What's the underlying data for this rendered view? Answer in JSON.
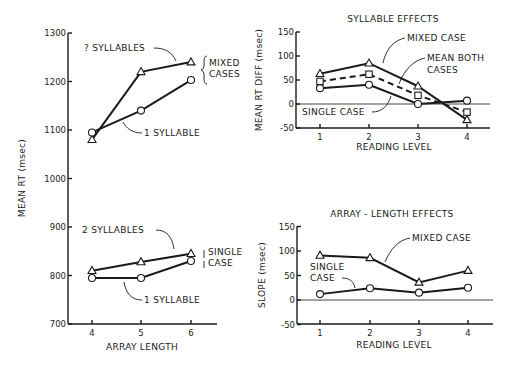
{
  "chart_data": [
    {
      "id": "array_length_rt",
      "type": "line",
      "title": "",
      "xlabel": "ARRAY LENGTH",
      "ylabel": "MEAN RT (msec)",
      "x": [
        4,
        5,
        6
      ],
      "x_tick_labels": [
        "4",
        "5",
        "6"
      ],
      "y_ticks": [
        700,
        800,
        900,
        1000,
        1100,
        1200,
        1300
      ],
      "ylim": [
        700,
        1300
      ],
      "grid": false,
      "groups": [
        {
          "name": "MIXED CASES",
          "series": [
            {
              "name": "2 SYLLABLES",
              "label_text": "? SYLLABLES",
              "marker": "triangle",
              "values": [
                1080,
                1220,
                1240
              ]
            },
            {
              "name": "1 SYLLABLE",
              "label_text": "1 SYLLABLE",
              "marker": "circle",
              "values": [
                1095,
                1140,
                1203
              ]
            }
          ]
        },
        {
          "name": "SINGLE CASE",
          "series": [
            {
              "name": "2 SYLLABLES",
              "label_text": "2 SYLLABLES",
              "marker": "triangle",
              "values": [
                810,
                828,
                845
              ]
            },
            {
              "name": "1 SYLLABLE",
              "label_text": "1 SYLLABLE",
              "marker": "circle",
              "values": [
                795,
                795,
                830
              ]
            }
          ]
        }
      ]
    },
    {
      "id": "syllable_effects",
      "type": "line",
      "title": "SYLLABLE EFFECTS",
      "xlabel": "READING LEVEL",
      "ylabel": "MEAN RT DIFF (msec)",
      "x": [
        1,
        2,
        3,
        4
      ],
      "x_tick_labels": [
        "1",
        "2",
        "3",
        "4"
      ],
      "y_ticks": [
        -50,
        0,
        50,
        100,
        150
      ],
      "ylim": [
        -50,
        150
      ],
      "zero_line": true,
      "grid": false,
      "series": [
        {
          "name": "MIXED CASE",
          "marker": "triangle",
          "line": "solid",
          "values": [
            63,
            85,
            37,
            -33
          ]
        },
        {
          "name": "MEAN BOTH CASES",
          "marker": "square",
          "line": "dashed",
          "values": [
            47,
            62,
            18,
            -17
          ]
        },
        {
          "name": "SINGLE CASE",
          "marker": "circle",
          "line": "solid",
          "values": [
            33,
            40,
            0,
            7
          ]
        }
      ]
    },
    {
      "id": "array_length_effects",
      "type": "line",
      "title": "ARRAY-LENGTH EFFECTS",
      "xlabel": "READING LEVEL",
      "ylabel": "SLOPE (msec)",
      "x": [
        1,
        2,
        3,
        4
      ],
      "x_tick_labels": [
        "1",
        "2",
        "3",
        "4"
      ],
      "y_ticks": [
        -50,
        0,
        50,
        100,
        150
      ],
      "ylim": [
        -50,
        150
      ],
      "zero_line": true,
      "grid": false,
      "series": [
        {
          "name": "MIXED CASE",
          "marker": "triangle",
          "line": "solid",
          "values": [
            91,
            86,
            36,
            60
          ]
        },
        {
          "name": "SINGLE CASE",
          "marker": "circle",
          "line": "solid",
          "values": [
            12,
            24,
            15,
            25
          ]
        }
      ]
    }
  ],
  "labels": {
    "left": {
      "ylabel": "MEAN RT (msec)",
      "xlabel": "ARRAY LENGTH",
      "mixed_top_label": "? SYLLABLES",
      "mixed_bottom_label": "1 SYLLABLE",
      "mixed_brace_line1": "MIXED",
      "mixed_brace_line2": "CASES",
      "single_top_label": "2 SYLLABLES",
      "single_bottom_label": "1 SYLLABLE",
      "single_brace_line1": "SINGLE",
      "single_brace_line2": "CASE"
    },
    "top_right": {
      "title": "SYLLABLE EFFECTS",
      "ylabel": "MEAN RT DIFF (msec)",
      "xlabel": "READING LEVEL",
      "mixed": "MIXED CASE",
      "mean_line1": "MEAN BOTH",
      "mean_line2": "CASES",
      "single": "SINGLE CASE"
    },
    "bottom_right": {
      "title": "ARRAY - LENGTH EFFECTS",
      "ylabel": "SLOPE (msec)",
      "xlabel": "READING LEVEL",
      "mixed": "MIXED CASE",
      "single_line1": "SINGLE",
      "single_line2": "CASE"
    }
  }
}
